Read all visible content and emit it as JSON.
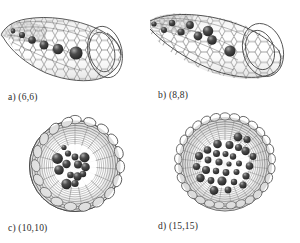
{
  "figure": {
    "kind": "scientific-illustration",
    "background_color": "#ffffff",
    "lattice_color": "#4a4a4a",
    "lattice_shade_color": "#8d8d8d",
    "sphere_color": "#3a3a3a",
    "sphere_highlight_color": "#8f8f8f",
    "caption_color": "#2b2b2b"
  },
  "panels": [
    {
      "id": "a",
      "caption": "a) (6,6)",
      "chirality": "(6,6)",
      "view": "side",
      "description": "open-ended armchair nanotube in perspective side view with a single-file chain of encapsulated atoms",
      "encapsulated_atom_count": 6
    },
    {
      "id": "b",
      "caption": "b) (8,8)",
      "chirality": "(8,8)",
      "view": "side",
      "description": "open-ended armchair nanotube in perspective side view with a zigzag double-row of encapsulated atoms",
      "encapsulated_atom_count": 9
    },
    {
      "id": "c",
      "caption": "c) (10,10)",
      "chirality": "(10,10)",
      "view": "axial",
      "description": "armchair nanotube viewed down the tube axis showing a central cluster of encapsulated atoms",
      "encapsulated_atom_count": 14
    },
    {
      "id": "d",
      "caption": "d) (15,15)",
      "chirality": "(15,15)",
      "view": "axial",
      "description": "larger armchair nanotube viewed down the tube axis showing a broad cluster of encapsulated atoms",
      "encapsulated_atom_count": 30
    }
  ]
}
